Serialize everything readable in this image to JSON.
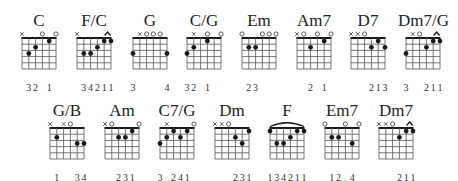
{
  "chords": [
    {
      "name": "C",
      "x": 14,
      "y": 12,
      "top": [
        "x",
        "",
        "",
        "o",
        "",
        "o"
      ],
      "dots": [
        [
          4,
          3
        ],
        [
          3,
          2
        ],
        [
          1,
          1
        ]
      ],
      "barre": null,
      "fingers": [
        "",
        "3",
        "2",
        "",
        "1",
        ""
      ]
    },
    {
      "name": "F/C",
      "x": 69,
      "y": 12,
      "top": [
        "x",
        "",
        "",
        "",
        "^",
        ""
      ],
      "dots": [
        [
          4,
          3
        ],
        [
          3,
          3
        ],
        [
          2,
          2
        ],
        [
          1,
          1
        ],
        [
          0,
          1
        ]
      ],
      "barre": [
        0,
        1,
        1
      ],
      "fingers": [
        "",
        "3",
        "4",
        "2",
        "1",
        "1"
      ]
    },
    {
      "name": "G",
      "x": 125,
      "y": 12,
      "top": [
        "",
        "x",
        "o",
        "o",
        "o",
        ""
      ],
      "dots": [
        [
          5,
          3
        ],
        [
          0,
          3
        ]
      ],
      "barre": null,
      "fingers": [
        "3",
        "",
        "",
        "",
        "",
        "4"
      ]
    },
    {
      "name": "C/G",
      "x": 179,
      "y": 12,
      "top": [
        "",
        "x",
        "",
        "o",
        "",
        "o"
      ],
      "dots": [
        [
          5,
          3
        ],
        [
          4,
          2
        ],
        [
          2,
          1
        ]
      ],
      "barre": null,
      "fingers": [
        "3",
        "2",
        "",
        "1",
        "",
        ""
      ]
    },
    {
      "name": "Em",
      "x": 234,
      "y": 12,
      "top": [
        "o",
        "",
        "",
        "o",
        "o",
        "o"
      ],
      "dots": [
        [
          4,
          2
        ],
        [
          3,
          2
        ]
      ],
      "barre": null,
      "fingers": [
        "",
        "2",
        "3",
        "",
        "",
        ""
      ]
    },
    {
      "name": "Am7",
      "x": 289,
      "y": 12,
      "top": [
        "x",
        "o",
        "",
        "o",
        "",
        "o"
      ],
      "dots": [
        [
          3,
          2
        ],
        [
          1,
          1
        ]
      ],
      "barre": null,
      "fingers": [
        "",
        "",
        "2",
        "",
        "1",
        ""
      ]
    },
    {
      "name": "D7",
      "x": 343,
      "y": 12,
      "top": [
        "x",
        "x",
        "o",
        "",
        "",
        ""
      ],
      "dots": [
        [
          2,
          2
        ],
        [
          1,
          1
        ],
        [
          0,
          2
        ]
      ],
      "barre": null,
      "fingers": [
        "",
        "",
        "",
        "2",
        "1",
        "3"
      ]
    },
    {
      "name": "Dm7/G",
      "x": 398,
      "y": 12,
      "top": [
        "",
        "x",
        "o",
        "",
        "^",
        ""
      ],
      "dots": [
        [
          5,
          3
        ],
        [
          2,
          2
        ],
        [
          1,
          1
        ],
        [
          0,
          1
        ]
      ],
      "barre": [
        0,
        1,
        1
      ],
      "fingers": [
        "3",
        "",
        "",
        "2",
        "1",
        "1"
      ]
    },
    {
      "name": "G/B",
      "x": 42,
      "y": 102,
      "top": [
        "x",
        "",
        "x",
        "o",
        "",
        ""
      ],
      "dots": [
        [
          4,
          2
        ],
        [
          1,
          3
        ],
        [
          0,
          3
        ]
      ],
      "barre": null,
      "fingers": [
        "",
        "1",
        "",
        "",
        "3",
        "4"
      ]
    },
    {
      "name": "Am",
      "x": 97,
      "y": 102,
      "top": [
        "x",
        "o",
        "",
        "",
        "",
        "o"
      ],
      "dots": [
        [
          3,
          2
        ],
        [
          2,
          2
        ],
        [
          1,
          1
        ]
      ],
      "barre": null,
      "fingers": [
        "",
        "",
        "2",
        "3",
        "1",
        ""
      ]
    },
    {
      "name": "C7/G",
      "x": 152,
      "y": 102,
      "top": [
        "",
        "x",
        "",
        "",
        "",
        "o"
      ],
      "dots": [
        [
          5,
          3
        ],
        [
          4,
          2
        ],
        [
          3,
          1
        ],
        [
          2,
          2
        ],
        [
          1,
          1
        ]
      ],
      "barre": null,
      "fingers": [
        "3",
        "",
        "2",
        "4",
        "1",
        ""
      ]
    },
    {
      "name": "Dm",
      "x": 207,
      "y": 102,
      "top": [
        "x",
        "x",
        "o",
        "",
        "",
        ""
      ],
      "dots": [
        [
          2,
          2
        ],
        [
          1,
          3
        ],
        [
          0,
          1
        ]
      ],
      "barre": null,
      "fingers": [
        "",
        "",
        "",
        "2",
        "3",
        "1"
      ]
    },
    {
      "name": "F",
      "x": 262,
      "y": 102,
      "top": [
        "",
        "",
        "",
        "",
        "",
        ""
      ],
      "dots": [
        [
          5,
          1
        ],
        [
          4,
          3
        ],
        [
          3,
          3
        ],
        [
          2,
          2
        ],
        [
          1,
          1
        ],
        [
          0,
          1
        ]
      ],
      "barre": [
        5,
        0,
        1
      ],
      "fingers": [
        "1",
        "3",
        "4",
        "2",
        "1",
        "1"
      ]
    },
    {
      "name": "Em7",
      "x": 317,
      "y": 102,
      "top": [
        "o",
        "",
        "",
        "o",
        "",
        "o"
      ],
      "dots": [
        [
          4,
          2
        ],
        [
          3,
          2
        ],
        [
          1,
          3
        ]
      ],
      "barre": null,
      "fingers": [
        "",
        "1",
        "2",
        "",
        "4",
        ""
      ]
    },
    {
      "name": "Dm7",
      "x": 371,
      "y": 102,
      "top": [
        "x",
        "x",
        "o",
        "",
        "^",
        ""
      ],
      "dots": [
        [
          2,
          2
        ],
        [
          1,
          1
        ],
        [
          0,
          1
        ]
      ],
      "barre": [
        0,
        1,
        1
      ],
      "fingers": [
        "",
        "",
        "",
        "2",
        "1",
        "1"
      ]
    }
  ],
  "colors": {
    "ink": "#1a1a1a",
    "grid": "#555555",
    "background": "#ffffff"
  }
}
